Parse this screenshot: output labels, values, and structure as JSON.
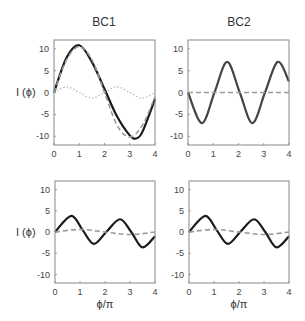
{
  "chart_data": [
    {
      "type": "line",
      "panel": "top-left",
      "title": "BC1",
      "xlabel": "",
      "ylabel": "I (ϕ)",
      "xlim": [
        0,
        4
      ],
      "ylim": [
        -12,
        12
      ],
      "xticks": [
        "0",
        "1",
        "2",
        "3",
        "4"
      ],
      "yticks": [
        "10",
        "5",
        "0",
        "-5",
        "-10"
      ],
      "series": [
        {
          "name": "solid",
          "style": "solid-black",
          "x": [
            0,
            0.5,
            1,
            1.5,
            2,
            2.5,
            3,
            3.25,
            3.5,
            4
          ],
          "values": [
            0,
            8,
            10.8,
            7,
            0.8,
            -5.5,
            -9.8,
            -10.5,
            -9,
            -1.5
          ]
        },
        {
          "name": "dashed",
          "style": "dashed-gray",
          "x": [
            0,
            0.5,
            1,
            1.5,
            2,
            2.5,
            3,
            3.5,
            4
          ],
          "values": [
            0,
            7.5,
            10.5,
            7.5,
            0,
            -7.5,
            -10.2,
            -7.5,
            -1
          ]
        },
        {
          "name": "dotted",
          "style": "dotted-lightgray",
          "x": [
            0,
            0.5,
            1,
            1.5,
            2,
            2.5,
            3,
            3.5,
            4
          ],
          "values": [
            0,
            1.3,
            0,
            -1.3,
            0,
            1.3,
            0,
            -1.3,
            0
          ]
        }
      ]
    },
    {
      "type": "line",
      "panel": "top-right",
      "title": "BC2",
      "xlabel": "",
      "ylabel": "",
      "xlim": [
        0,
        4
      ],
      "ylim": [
        -12,
        12
      ],
      "xticks": [
        "0",
        "1",
        "2",
        "3",
        "4"
      ],
      "yticks": [
        "10",
        "5",
        "0",
        "-5",
        "-10"
      ],
      "series": [
        {
          "name": "solid",
          "style": "solid-darkgray",
          "x": [
            0,
            0.55,
            1.05,
            1.55,
            2.05,
            2.55,
            3.05,
            3.55,
            4
          ],
          "values": [
            0,
            -7,
            0,
            7,
            0,
            -7,
            0,
            7,
            2.5
          ]
        },
        {
          "name": "dashed",
          "style": "dashed-gray",
          "x": [
            0,
            4
          ],
          "values": [
            0,
            0
          ]
        }
      ]
    },
    {
      "type": "line",
      "panel": "bottom-left",
      "title": "",
      "xlabel": "ϕ/π",
      "ylabel": "I (ϕ)",
      "xlim": [
        0,
        4
      ],
      "ylim": [
        -12,
        12
      ],
      "xticks": [
        "0",
        "1",
        "2",
        "3",
        "4"
      ],
      "yticks": [
        "10",
        "5",
        "0",
        "-5",
        "-10"
      ],
      "series": [
        {
          "name": "solid",
          "style": "solid-black",
          "x": [
            0,
            0.65,
            1.1,
            1.55,
            2.05,
            2.6,
            3.05,
            3.5,
            4
          ],
          "values": [
            0,
            3.8,
            0.5,
            -2.8,
            0,
            3,
            0,
            -3.6,
            -1
          ]
        },
        {
          "name": "dashed",
          "style": "dashed-gray",
          "x": [
            0,
            1,
            2,
            3,
            4
          ],
          "values": [
            0,
            0.6,
            0,
            -0.6,
            0
          ]
        }
      ]
    },
    {
      "type": "line",
      "panel": "bottom-right",
      "title": "",
      "xlabel": "ϕ/π",
      "ylabel": "",
      "xlim": [
        0,
        4
      ],
      "ylim": [
        -12,
        12
      ],
      "xticks": [
        "0",
        "1",
        "2",
        "3",
        "4"
      ],
      "yticks": [
        "10",
        "5",
        "0",
        "-5",
        "-10"
      ],
      "series": [
        {
          "name": "solid",
          "style": "solid-black",
          "x": [
            0,
            0.65,
            1.1,
            1.55,
            2.05,
            2.6,
            3.05,
            3.5,
            4
          ],
          "values": [
            0,
            3.8,
            0.5,
            -2.8,
            0,
            3,
            0,
            -3.6,
            -1
          ]
        },
        {
          "name": "dashed",
          "style": "dashed-gray",
          "x": [
            0,
            1,
            2,
            3,
            4
          ],
          "values": [
            0,
            0.6,
            0,
            -0.6,
            0
          ]
        }
      ]
    }
  ],
  "labels": {
    "title_bc1": "BC1",
    "title_bc2": "BC2",
    "ylabel_top": "I (ϕ)",
    "ylabel_bottom": "I (ϕ)",
    "xlabel_left": "ϕ/π",
    "xlabel_right": "ϕ/π"
  }
}
